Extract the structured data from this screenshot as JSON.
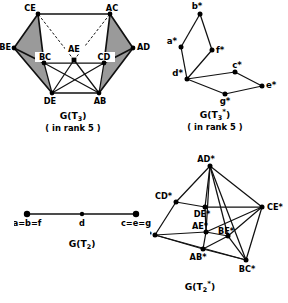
{
  "figure": {
    "background_color": "#ffffff",
    "ink_color": "#111111",
    "shade_color": "#9a9a9a"
  },
  "panels": [
    {
      "id": "g-t3",
      "caption_main": "G(T",
      "caption_sub": "3",
      "caption_close": ")",
      "caption_sup": "",
      "caption_note": "( in rank 5 )",
      "graph_type": "polyhedral-graph-shaded",
      "vertices": [
        {
          "label": "CE",
          "x": 38,
          "y": 14,
          "label_dx": -8,
          "label_dy": -3,
          "anchor": "middle"
        },
        {
          "label": "AC",
          "x": 110,
          "y": 14,
          "label_dx": 2,
          "label_dy": -3,
          "anchor": "middle"
        },
        {
          "label": "BE",
          "x": 14,
          "y": 48,
          "label_dx": -13,
          "label_dy": 2,
          "anchor": "end"
        },
        {
          "label": "AD",
          "x": 133,
          "y": 48,
          "label_dx": 4,
          "label_dy": 2,
          "anchor": "start"
        },
        {
          "label": "BC",
          "x": 44,
          "y": 63,
          "label_dx": -1,
          "label_dy": -3,
          "anchor": "middle"
        },
        {
          "label": "CD",
          "x": 104,
          "y": 63,
          "label_dx": 0,
          "label_dy": -3,
          "anchor": "middle"
        },
        {
          "label": "AE",
          "x": 74,
          "y": 60,
          "label_dx": 0,
          "label_dy": -8,
          "anchor": "middle"
        },
        {
          "label": "DE",
          "x": 52,
          "y": 93,
          "label_dx": -2,
          "label_dy": 11,
          "anchor": "middle"
        },
        {
          "label": "AB",
          "x": 99,
          "y": 93,
          "label_dx": 1,
          "label_dy": 11,
          "anchor": "middle"
        }
      ],
      "edges": [
        {
          "from": "CE",
          "to": "AC",
          "style": "solid"
        },
        {
          "from": "CE",
          "to": "BE",
          "style": "solid"
        },
        {
          "from": "CE",
          "to": "BC",
          "style": "solid"
        },
        {
          "from": "AC",
          "to": "AD",
          "style": "solid"
        },
        {
          "from": "AC",
          "to": "CD",
          "style": "solid"
        },
        {
          "from": "BE",
          "to": "BC",
          "style": "solid"
        },
        {
          "from": "BE",
          "to": "DE",
          "style": "solid"
        },
        {
          "from": "AD",
          "to": "CD",
          "style": "solid"
        },
        {
          "from": "AD",
          "to": "AB",
          "style": "solid"
        },
        {
          "from": "BC",
          "to": "CD",
          "style": "solid"
        },
        {
          "from": "BC",
          "to": "DE",
          "style": "solid"
        },
        {
          "from": "CD",
          "to": "AB",
          "style": "solid"
        },
        {
          "from": "BC",
          "to": "AB",
          "style": "solid"
        },
        {
          "from": "CD",
          "to": "DE",
          "style": "solid"
        },
        {
          "from": "DE",
          "to": "AB",
          "style": "solid"
        },
        {
          "from": "AE",
          "to": "DE",
          "style": "solid"
        },
        {
          "from": "AE",
          "to": "AB",
          "style": "solid"
        },
        {
          "from": "AE",
          "to": "CE",
          "style": "dashed"
        },
        {
          "from": "AE",
          "to": "AC",
          "style": "dashed"
        }
      ],
      "shaded_faces": [
        [
          "CE",
          "BE",
          "BC"
        ],
        [
          "BE",
          "DE",
          "BC"
        ],
        [
          "AC",
          "AD",
          "CD"
        ],
        [
          "AD",
          "AB",
          "CD"
        ]
      ]
    },
    {
      "id": "g-t3-star",
      "caption_main": "G(T",
      "caption_sub": "3",
      "caption_sup": "*",
      "caption_close": ")",
      "caption_note": "( in rank 5 )",
      "graph_type": "planar-graph",
      "vertices": [
        {
          "label": "b*",
          "x": 37,
          "y": 12,
          "label_dx": -2,
          "label_dy": -4,
          "anchor": "middle"
        },
        {
          "label": "a*",
          "x": 18,
          "y": 45,
          "label_dx": -4,
          "label_dy": -3,
          "anchor": "end"
        },
        {
          "label": "f*",
          "x": 49,
          "y": 48,
          "label_dx": 4,
          "label_dy": 3,
          "anchor": "start"
        },
        {
          "label": "d*",
          "x": 24,
          "y": 77,
          "label_dx": -4,
          "label_dy": -3,
          "anchor": "end"
        },
        {
          "label": "c*",
          "x": 72,
          "y": 70,
          "label_dx": 2,
          "label_dy": -4,
          "anchor": "middle"
        },
        {
          "label": "g*",
          "x": 62,
          "y": 92,
          "label_dx": 0,
          "label_dy": 10,
          "anchor": "middle"
        },
        {
          "label": "e*",
          "x": 99,
          "y": 84,
          "label_dx": 4,
          "label_dy": 2,
          "anchor": "start"
        }
      ],
      "edges": [
        {
          "from": "b*",
          "to": "a*",
          "style": "solid"
        },
        {
          "from": "b*",
          "to": "f*",
          "style": "solid"
        },
        {
          "from": "a*",
          "to": "d*",
          "style": "solid"
        },
        {
          "from": "f*",
          "to": "d*",
          "style": "solid"
        },
        {
          "from": "d*",
          "to": "c*",
          "style": "solid"
        },
        {
          "from": "d*",
          "to": "g*",
          "style": "solid"
        },
        {
          "from": "c*",
          "to": "e*",
          "style": "solid"
        },
        {
          "from": "g*",
          "to": "e*",
          "style": "solid"
        }
      ],
      "shaded_faces": []
    },
    {
      "id": "g-t2",
      "caption_main": "G(T",
      "caption_sub": "2",
      "caption_sup": "",
      "caption_close": ")",
      "caption_note": "",
      "graph_type": "path-graph",
      "vertices": [
        {
          "label": "a=b=f",
          "x": 13,
          "y": 14,
          "label_dx": 0,
          "label_dy": 12,
          "anchor": "middle"
        },
        {
          "label": "d",
          "x": 68,
          "y": 14,
          "label_dx": 0,
          "label_dy": 12,
          "anchor": "middle"
        },
        {
          "label": "c=e=g",
          "x": 122,
          "y": 14,
          "label_dx": 0,
          "label_dy": 12,
          "anchor": "middle"
        }
      ],
      "edges": [
        {
          "from": "a=b=f",
          "to": "d",
          "style": "solid"
        },
        {
          "from": "d",
          "to": "c=e=g",
          "style": "solid"
        }
      ],
      "shaded_faces": []
    },
    {
      "id": "g-t2-star",
      "caption_main": "G(T",
      "caption_sub": "2",
      "caption_sup": "*",
      "caption_close": ")",
      "caption_note": "",
      "graph_type": "dense-graph",
      "vertices": [
        {
          "label": "AD*",
          "x": 60,
          "y": 14,
          "label_dx": -3,
          "label_dy": -4,
          "anchor": "middle"
        },
        {
          "label": "CD*",
          "x": 26,
          "y": 50,
          "label_dx": -5,
          "label_dy": -3,
          "anchor": "end"
        },
        {
          "label": "DE*",
          "x": 55,
          "y": 55,
          "label_dx": -2,
          "label_dy": 10,
          "anchor": "middle"
        },
        {
          "label": "CE*",
          "x": 112,
          "y": 55,
          "label_dx": 5,
          "label_dy": 2,
          "anchor": "start"
        },
        {
          "label": "AC*",
          "x": 5,
          "y": 83,
          "label_dx": -3,
          "label_dy": 3,
          "anchor": "end"
        },
        {
          "label": "AE*",
          "x": 56,
          "y": 80,
          "label_dx": -3,
          "label_dy": -4,
          "anchor": "middle"
        },
        {
          "label": "BE*",
          "x": 78,
          "y": 84,
          "label_dx": 0,
          "label_dy": -3,
          "anchor": "middle"
        },
        {
          "label": "AB*",
          "x": 53,
          "y": 97,
          "label_dx": -4,
          "label_dy": 10,
          "anchor": "middle"
        },
        {
          "label": "BC*",
          "x": 96,
          "y": 108,
          "label_dx": 0,
          "label_dy": 11,
          "anchor": "middle"
        }
      ],
      "edges": [
        {
          "from": "AD*",
          "to": "CD*",
          "style": "solid"
        },
        {
          "from": "AD*",
          "to": "DE*",
          "style": "solid"
        },
        {
          "from": "AD*",
          "to": "CE*",
          "style": "solid"
        },
        {
          "from": "AD*",
          "to": "AE*",
          "style": "solid"
        },
        {
          "from": "AD*",
          "to": "BE*",
          "style": "solid"
        },
        {
          "from": "AD*",
          "to": "BC*",
          "style": "solid"
        },
        {
          "from": "CD*",
          "to": "DE*",
          "style": "solid"
        },
        {
          "from": "CD*",
          "to": "AC*",
          "style": "solid"
        },
        {
          "from": "DE*",
          "to": "CE*",
          "style": "solid"
        },
        {
          "from": "DE*",
          "to": "AE*",
          "style": "solid"
        },
        {
          "from": "CE*",
          "to": "AE*",
          "style": "solid"
        },
        {
          "from": "CE*",
          "to": "BE*",
          "style": "solid"
        },
        {
          "from": "CE*",
          "to": "BC*",
          "style": "solid"
        },
        {
          "from": "AC*",
          "to": "AE*",
          "style": "solid"
        },
        {
          "from": "AC*",
          "to": "AB*",
          "style": "solid"
        },
        {
          "from": "AC*",
          "to": "BC*",
          "style": "solid"
        },
        {
          "from": "AE*",
          "to": "BE*",
          "style": "solid"
        },
        {
          "from": "AE*",
          "to": "AB*",
          "style": "solid"
        },
        {
          "from": "BE*",
          "to": "AB*",
          "style": "solid"
        },
        {
          "from": "BE*",
          "to": "BC*",
          "style": "solid"
        },
        {
          "from": "AB*",
          "to": "BC*",
          "style": "solid"
        }
      ],
      "shaded_faces": []
    }
  ]
}
